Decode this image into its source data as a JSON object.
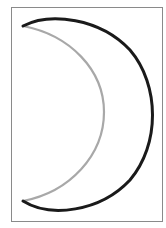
{
  "figure": {
    "colors": {
      "background": "#ffffff",
      "frame": "#8a8a8a",
      "outer_arc": "#1a1a1a",
      "inner_arc": "#a8a8a8"
    },
    "frame_rect": {
      "x": 11.5,
      "y": 7.5,
      "width": 151,
      "height": 214
    },
    "outer_arc_path": "M 23 26 C 50 12, 100 18, 130 50 C 160 85, 160 145, 130 180 C 100 212, 50 218, 23 201",
    "inner_arc_path": "M 23 26 C 70 35, 104 70, 104 112 C 104 155, 70 192, 23 201",
    "outer_stroke_width": 3,
    "inner_stroke_width": 2.2
  }
}
